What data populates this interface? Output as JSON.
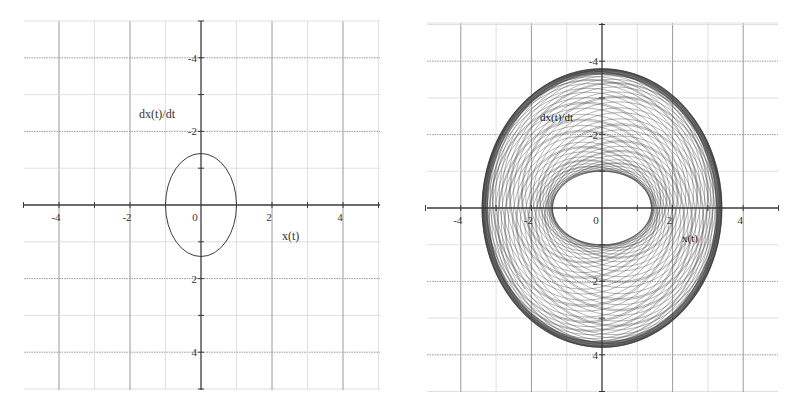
{
  "chart_data": [
    {
      "type": "line",
      "title": "",
      "xlabel": "x(t)",
      "ylabel": "dx(t)/dt",
      "xlim": [
        -5,
        5
      ],
      "ylim": [
        -5,
        5
      ],
      "xticks": [
        -4,
        -2,
        0,
        2,
        4
      ],
      "yticks": [
        -4,
        -2,
        2,
        4
      ],
      "x_tick_labels": [
        "-4",
        "-2",
        "0",
        "2",
        "4"
      ],
      "y_tick_labels": [
        "4",
        "2",
        "-2",
        "-4"
      ],
      "grid": true,
      "legend": null,
      "series": [
        {
          "name": "closed orbit (ellipse)",
          "shape": "ellipse",
          "center": [
            0,
            0
          ],
          "x_semi_axis": 1.0,
          "y_semi_axis": 1.4
        }
      ]
    },
    {
      "type": "line",
      "title": "",
      "xlabel": "x(t)",
      "ylabel": "dx(t)/dt",
      "xlim": [
        -5,
        5
      ],
      "ylim": [
        -5,
        5
      ],
      "xticks": [
        -4,
        -2,
        0,
        2,
        4
      ],
      "yticks": [
        -4,
        -2,
        2,
        4
      ],
      "x_tick_labels": [
        "-4",
        "-2",
        "0",
        "2",
        "4"
      ],
      "y_tick_labels": [
        "4",
        "2",
        "-2",
        "-4"
      ],
      "grid": true,
      "legend": null,
      "series": [
        {
          "name": "quasi-periodic trajectory (annular band)",
          "shape": "annulus",
          "center": [
            0,
            0
          ],
          "outer_x_semi_axis": 3.4,
          "outer_y_semi_axis": 3.8,
          "inner_x_semi_axis": 1.4,
          "inner_y_semi_axis": 1.0
        }
      ]
    }
  ],
  "colors": {
    "axis": "#3a3a3a",
    "major_grid": "#9a9a9a",
    "minor_grid": "#d8d8d8",
    "curve": "#3c3c3c"
  }
}
